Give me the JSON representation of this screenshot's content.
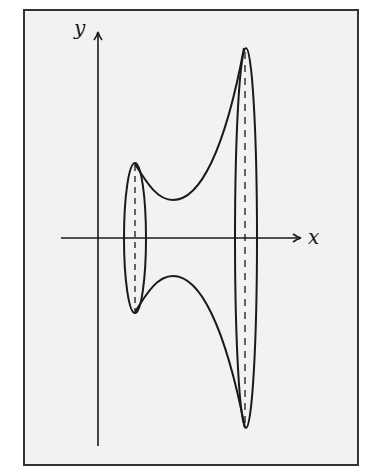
{
  "diagram": {
    "type": "surface-of-revolution",
    "axes": {
      "x_label": "x",
      "y_label": "y"
    },
    "elements": [
      {
        "name": "small-ellipse",
        "kind": "cross-section",
        "dashed_axis": true
      },
      {
        "name": "large-ellipse",
        "kind": "cross-section",
        "dashed_axis": true
      },
      {
        "name": "upper-profile-curve",
        "kind": "curve"
      },
      {
        "name": "lower-profile-curve",
        "kind": "curve"
      }
    ],
    "colors": {
      "background": "#f2f2f2",
      "stroke": "#1a1a1a",
      "frame": "#333333"
    }
  }
}
